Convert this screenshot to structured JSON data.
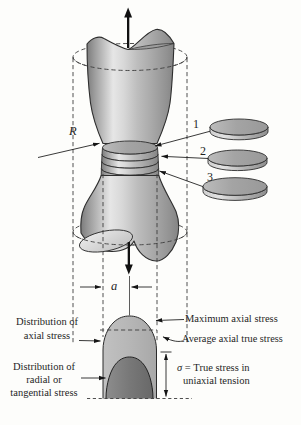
{
  "figure": {
    "specimen": {
      "radius_label": "R",
      "neck_radius_label": "a"
    },
    "slices": [
      {
        "label": "1"
      },
      {
        "label": "2"
      },
      {
        "label": "3"
      }
    ],
    "annotations": {
      "dist_axial_1": "Distribution of",
      "dist_axial_2": "axial stress",
      "dist_radial_1": "Distribution of",
      "dist_radial_2": "radial or",
      "dist_radial_3": "tangential stress",
      "max_axial": "Maximum axial stress",
      "avg_axial": "Average axial true stress",
      "sigma_symbol": "σ",
      "sigma_text": "= True stress in",
      "sigma_text_2": "uniaxial tension"
    },
    "colors": {
      "background": "#fdfdfb",
      "ink": "#1f1f1f",
      "outline": "#2e2e2e",
      "body_gray": "#c9c9c9",
      "axial_dome": "#b5b5b5",
      "radial_dome": "#787878"
    }
  }
}
